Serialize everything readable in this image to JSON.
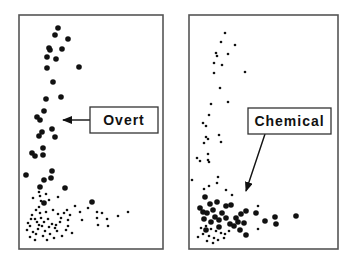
{
  "chart_data": [
    {
      "type": "scatter",
      "title": "",
      "xlabel": "",
      "ylabel": "",
      "grid": false,
      "legend": null,
      "annotation": {
        "label": "Overt",
        "box": [
          90,
          107,
          68,
          26
        ],
        "arrow_from": [
          90,
          120
        ],
        "arrow_to": [
          63,
          120
        ]
      },
      "frame": [
        19,
        15,
        144,
        234
      ],
      "series": [
        {
          "name": "large points",
          "marker_radius": 2.8,
          "points": [
            [
              58,
              28
            ],
            [
              55,
              35
            ],
            [
              68,
              39
            ],
            [
              49,
              48
            ],
            [
              50,
              50
            ],
            [
              62,
              49
            ],
            [
              47,
              57
            ],
            [
              56,
              59
            ],
            [
              47,
              68
            ],
            [
              79,
              67
            ],
            [
              53,
              82
            ],
            [
              46,
              99
            ],
            [
              61,
              97
            ],
            [
              44,
              111
            ],
            [
              37,
              117
            ],
            [
              40,
              120
            ],
            [
              42,
              132
            ],
            [
              39,
              136
            ],
            [
              52,
              129
            ],
            [
              55,
              137
            ],
            [
              32,
              153
            ],
            [
              35,
              156
            ],
            [
              43,
              148
            ],
            [
              43,
              155
            ],
            [
              26,
              175
            ],
            [
              52,
              171
            ],
            [
              44,
              180
            ],
            [
              51,
              178
            ],
            [
              40,
              187
            ],
            [
              65,
              188
            ],
            [
              44,
              203
            ]
          ]
        },
        {
          "name": "small points",
          "marker_radius": 1.3,
          "points": [
            [
              39,
              192
            ],
            [
              46,
              194
            ],
            [
              33,
              198
            ],
            [
              41,
              201
            ],
            [
              49,
              200
            ],
            [
              58,
              197
            ],
            [
              53,
              210
            ],
            [
              40,
              213
            ],
            [
              32,
              215
            ],
            [
              46,
              212
            ],
            [
              39,
              207
            ],
            [
              28,
              223
            ],
            [
              35,
              219
            ],
            [
              30,
              226
            ],
            [
              37,
              222
            ],
            [
              42,
              226
            ],
            [
              48,
              219
            ],
            [
              52,
              224
            ],
            [
              45,
              231
            ],
            [
              38,
              229
            ],
            [
              33,
              232
            ],
            [
              27,
              230
            ],
            [
              55,
              228
            ],
            [
              60,
              222
            ],
            [
              64,
              213
            ],
            [
              61,
              218
            ],
            [
              67,
              210
            ],
            [
              57,
              231
            ],
            [
              50,
              234
            ],
            [
              43,
              236
            ],
            [
              36,
              234
            ],
            [
              30,
              237
            ],
            [
              47,
              240
            ],
            [
              62,
              236
            ],
            [
              68,
              226
            ],
            [
              72,
              233
            ],
            [
              68,
              220
            ],
            [
              35,
              240
            ],
            [
              54,
              238
            ],
            [
              41,
              218
            ],
            [
              49,
              227
            ],
            [
              58,
              214
            ],
            [
              44,
              222
            ],
            [
              31,
              219
            ],
            [
              39,
              225
            ],
            [
              56,
              225
            ],
            [
              70,
              215
            ],
            [
              66,
              230
            ],
            [
              75,
              206
            ],
            [
              80,
              212
            ],
            [
              82,
              220
            ],
            [
              88,
              208
            ],
            [
              97,
              212
            ],
            [
              102,
              213
            ],
            [
              97,
              218
            ],
            [
              107,
              219
            ],
            [
              108,
              226
            ],
            [
              118,
              216
            ],
            [
              128,
              212
            ],
            [
              98,
              225
            ],
            [
              40,
              196
            ],
            [
              36,
              210
            ]
          ]
        },
        {
          "name": "large outlier",
          "marker_radius": 2.8,
          "points": [
            [
              92,
              202
            ]
          ]
        }
      ]
    },
    {
      "type": "scatter",
      "title": "",
      "xlabel": "",
      "ylabel": "",
      "grid": false,
      "legend": null,
      "annotation": {
        "label": "Chemical",
        "box": [
          248,
          108,
          83,
          26
        ],
        "arrow_from": [
          265,
          134
        ],
        "arrow_to": [
          246,
          191
        ]
      },
      "frame": [
        189,
        15,
        149,
        234
      ],
      "series": [
        {
          "name": "small points",
          "marker_radius": 1.3,
          "points": [
            [
              225,
              33
            ],
            [
              221,
              42
            ],
            [
              235,
              45
            ],
            [
              216,
              53
            ],
            [
              217,
              56
            ],
            [
              228,
              54
            ],
            [
              214,
              63
            ],
            [
              222,
              65
            ],
            [
              214,
              73
            ],
            [
              245,
              72
            ],
            [
              220,
              88
            ],
            [
              211,
              104
            ],
            [
              228,
              102
            ],
            [
              209,
              115
            ],
            [
              203,
              123
            ],
            [
              206,
              126
            ],
            [
              206,
              137
            ],
            [
              208,
              139
            ],
            [
              219,
              135
            ],
            [
              221,
              142
            ],
            [
              204,
              143
            ],
            [
              197,
              158
            ],
            [
              200,
              161
            ],
            [
              208,
              154
            ],
            [
              208,
              160
            ],
            [
              209,
              162
            ],
            [
              218,
              177
            ],
            [
              217,
              183
            ],
            [
              192,
              180
            ],
            [
              209,
              186
            ],
            [
              204,
              189
            ],
            [
              226,
              190
            ],
            [
              232,
              195
            ],
            [
              258,
              206
            ],
            [
              258,
              229
            ],
            [
              206,
              226
            ],
            [
              201,
              228
            ],
            [
              211,
              229
            ],
            [
              216,
              231
            ],
            [
              221,
              233
            ],
            [
              203,
              234
            ],
            [
              209,
              236
            ],
            [
              214,
              238
            ],
            [
              224,
              238
            ],
            [
              198,
              237
            ],
            [
              229,
              231
            ],
            [
              218,
              240
            ],
            [
              207,
              241
            ],
            [
              213,
              243
            ],
            [
              225,
              234
            ]
          ]
        },
        {
          "name": "large points",
          "marker_radius": 2.8,
          "points": [
            [
              205,
              197
            ],
            [
              210,
              204
            ],
            [
              200,
              208
            ],
            [
              213,
              210
            ],
            [
              217,
              202
            ],
            [
              226,
              206
            ],
            [
              231,
              205
            ],
            [
              222,
              213
            ],
            [
              207,
              213
            ],
            [
              215,
              217
            ],
            [
              204,
              219
            ],
            [
              211,
              222
            ],
            [
              219,
              220
            ],
            [
              226,
              218
            ],
            [
              230,
              224
            ],
            [
              236,
              218
            ],
            [
              241,
              214
            ],
            [
              238,
              222
            ],
            [
              246,
              211
            ],
            [
              234,
              226
            ],
            [
              244,
              223
            ],
            [
              240,
              230
            ],
            [
              246,
              235
            ],
            [
              219,
              227
            ],
            [
              206,
              230
            ],
            [
              203,
              212
            ],
            [
              256,
              213
            ],
            [
              265,
              221
            ],
            [
              275,
              217
            ],
            [
              276,
              224
            ],
            [
              296,
              216
            ]
          ]
        }
      ]
    }
  ]
}
